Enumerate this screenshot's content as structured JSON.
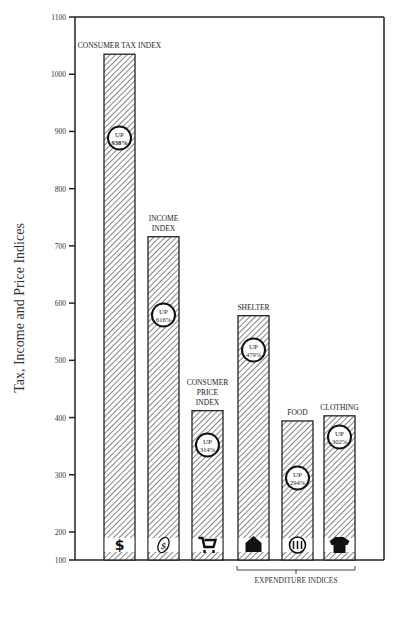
{
  "chart_data": {
    "type": "bar",
    "title": "",
    "xlabel": "",
    "ylabel": "Tax, Income and Price Indices",
    "ylim": [
      100,
      1100
    ],
    "yticks": [
      100,
      200,
      300,
      400,
      500,
      600,
      700,
      800,
      900,
      1000,
      1100
    ],
    "grid": false,
    "categories": [
      "CONSUMER TAX INDEX",
      "INCOME INDEX",
      "CONSUMER PRICE INDEX",
      "SHELTER",
      "FOOD",
      "CLOTHING"
    ],
    "values": [
      1035,
      716,
      412,
      578,
      394,
      403
    ],
    "annotations": [
      "UP 938%",
      "UP 616%",
      "UP 314%",
      "UP 479%",
      "UP 294%",
      "UP 302%"
    ],
    "icons": [
      "dollar-icon",
      "money-bag-icon",
      "shopping-cart-icon",
      "house-icon",
      "fork-knife-plate-icon",
      "shirt-icon"
    ],
    "group_label": "EXPENDITURE INDICES",
    "group_members": [
      "SHELTER",
      "FOOD",
      "CLOTHING"
    ]
  },
  "labels": {
    "ylabel": "Tax, Income and Price Indices",
    "bars": [
      {
        "lines": [
          "CONSUMER TAX INDEX"
        ],
        "up": "UP",
        "pct": "938%"
      },
      {
        "lines": [
          "INCOME",
          "INDEX"
        ],
        "up": "UP",
        "pct": "616%"
      },
      {
        "lines": [
          "CONSUMER",
          "PRICE",
          "INDEX"
        ],
        "up": "UP",
        "pct": "314%"
      },
      {
        "lines": [
          "SHELTER"
        ],
        "up": "UP",
        "pct": "479%"
      },
      {
        "lines": [
          "FOOD"
        ],
        "up": "UP",
        "pct": "294%"
      },
      {
        "lines": [
          "CLOTHING"
        ],
        "up": "UP",
        "pct": "302%"
      }
    ],
    "group": "EXPENDITURE INDICES"
  }
}
